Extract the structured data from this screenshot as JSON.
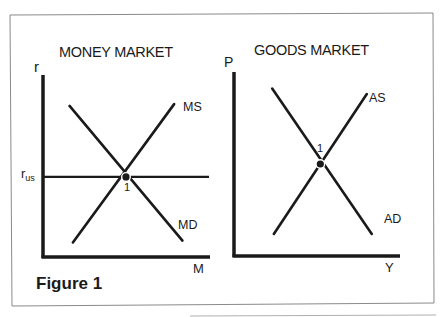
{
  "figure": {
    "caption": "Figure 1",
    "colors": {
      "ink": "#1a1a1a",
      "frame": "#8a8a8a",
      "background": "#ffffff"
    }
  },
  "chart_data": [
    {
      "type": "line",
      "title": "MONEY MARKET",
      "xlabel": "M",
      "ylabel": "r",
      "grid": false,
      "xlim": [
        0,
        10
      ],
      "ylim": [
        0,
        10
      ],
      "reference_lines": [
        {
          "name": "r_us",
          "label_main": "r",
          "label_sub": "us",
          "orientation": "horizontal",
          "y": 4.4
        }
      ],
      "series": [
        {
          "name": "MS",
          "slope": "upward",
          "points": [
            [
              1.8,
              0.8
            ],
            [
              7.9,
              8.4
            ]
          ]
        },
        {
          "name": "MD",
          "slope": "downward",
          "points": [
            [
              1.6,
              8.3
            ],
            [
              8.4,
              0.9
            ]
          ]
        }
      ],
      "equilibrium": {
        "label": "1",
        "x": 5.0,
        "y": 4.4
      }
    },
    {
      "type": "line",
      "title": "GOODS MARKET",
      "xlabel": "Y",
      "ylabel": "P",
      "grid": false,
      "xlim": [
        0,
        10
      ],
      "ylim": [
        0,
        10
      ],
      "series": [
        {
          "name": "AS",
          "slope": "upward",
          "points": [
            [
              2.4,
              1.2
            ],
            [
              8.0,
              8.8
            ]
          ]
        },
        {
          "name": "AD",
          "slope": "downward",
          "points": [
            [
              2.3,
              9.1
            ],
            [
              8.3,
              1.2
            ]
          ]
        }
      ],
      "equilibrium": {
        "label": "1",
        "x": 5.2,
        "y": 5.0
      }
    }
  ]
}
